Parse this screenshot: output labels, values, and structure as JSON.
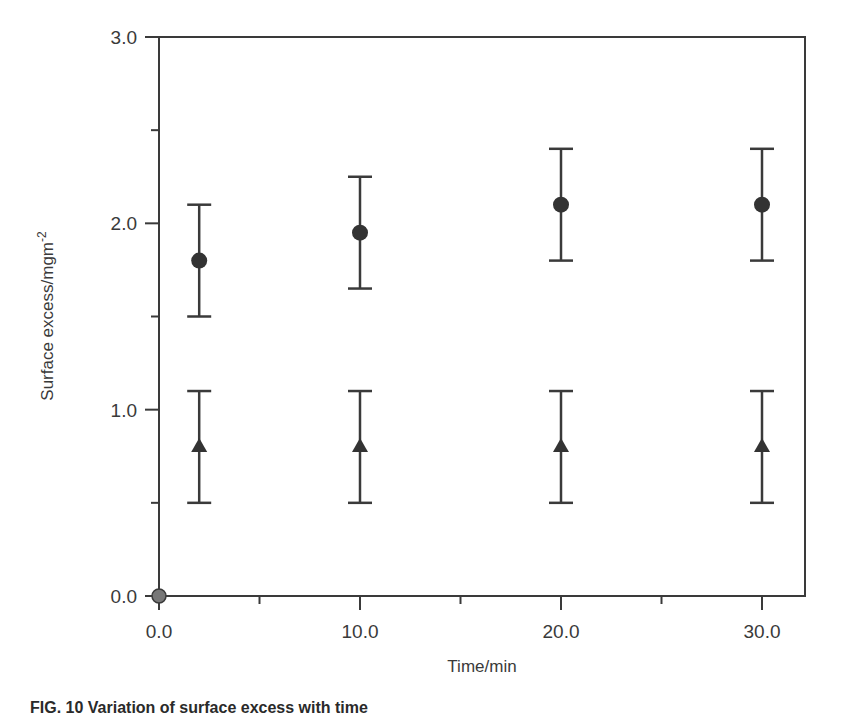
{
  "chart_data": {
    "type": "scatter",
    "title": "",
    "xlabel": "Time/min",
    "ylabel": "Surface excess/mgm",
    "ylabel_superscript": "-2",
    "xlim": [
      0,
      32
    ],
    "ylim": [
      0,
      3.0
    ],
    "x_ticks": [
      0,
      10,
      20,
      30
    ],
    "x_tick_labels": [
      "0.0",
      "10.0",
      "20.0",
      "30.0"
    ],
    "x_minor_ticks": [
      5,
      15,
      25
    ],
    "y_ticks": [
      0,
      1,
      2,
      3
    ],
    "y_tick_labels": [
      "0.0",
      "1.0",
      "2.0",
      "3.0"
    ],
    "y_minor_ticks": [
      0.5,
      1.5,
      2.5
    ],
    "grid": false,
    "legend": null,
    "series": [
      {
        "name": "circles",
        "marker": "circle",
        "x": [
          2,
          10,
          20,
          30
        ],
        "y": [
          1.8,
          1.95,
          2.1,
          2.1
        ],
        "y_err_low": [
          1.5,
          1.65,
          1.8,
          1.8
        ],
        "y_err_high": [
          2.1,
          2.25,
          2.4,
          2.4
        ]
      },
      {
        "name": "triangles",
        "marker": "triangle",
        "x": [
          2,
          10,
          20,
          30
        ],
        "y": [
          0.8,
          0.8,
          0.8,
          0.8
        ],
        "y_err_low": [
          0.5,
          0.5,
          0.5,
          0.5
        ],
        "y_err_high": [
          1.1,
          1.1,
          1.1,
          1.1
        ]
      },
      {
        "name": "origin",
        "marker": "circle-grey",
        "x": [
          0
        ],
        "y": [
          0
        ]
      }
    ],
    "colors": {
      "axis": "#3a3a3a",
      "marker": "#333333",
      "origin_marker": "#777777"
    }
  },
  "caption": "FIG. 10   Variation of surface excess with time"
}
